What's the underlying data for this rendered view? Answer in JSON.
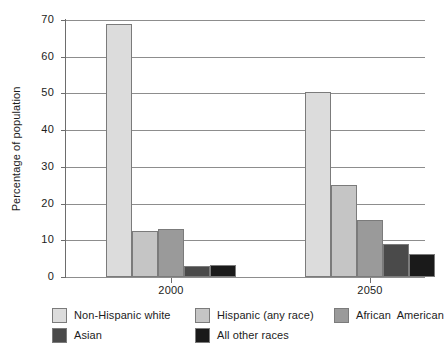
{
  "chart_data": {
    "type": "bar",
    "title": "",
    "xlabel": "",
    "ylabel": "Percentage of population",
    "ylim": [
      0,
      70
    ],
    "ytick_step": 10,
    "yticks": [
      "70",
      "60",
      "50",
      "40",
      "30",
      "20",
      "10",
      "0"
    ],
    "grid": true,
    "legend_position": "bottom",
    "categories": [
      "2000",
      "2050"
    ],
    "series": [
      {
        "name": "Non-Hispanic white",
        "color": "#dcdcdc",
        "values": [
          69.0,
          50.5
        ]
      },
      {
        "name": "Hispanic (any race)",
        "color": "#c5c5c5",
        "values": [
          12.5,
          25.0
        ]
      },
      {
        "name": "African  American",
        "color": "#9a9a9a",
        "values": [
          13.0,
          15.5
        ]
      },
      {
        "name": "Asian",
        "color": "#4a4a4a",
        "values": [
          3.0,
          9.0
        ]
      },
      {
        "name": "All other races",
        "color": "#1a1a1a",
        "values": [
          3.3,
          6.3
        ]
      }
    ]
  },
  "axes": {
    "y_axis_label": "Percentage of population",
    "y_ticks": [
      "70",
      "60",
      "50",
      "40",
      "30",
      "20",
      "10",
      "0"
    ],
    "x_ticks": [
      "2000",
      "2050"
    ]
  },
  "legend": {
    "entries": [
      {
        "label": "Non-Hispanic white",
        "color": "#dcdcdc"
      },
      {
        "label": "Hispanic (any race)",
        "color": "#c5c5c5"
      },
      {
        "label": "African  American",
        "color": "#9a9a9a"
      },
      {
        "label": "Asian",
        "color": "#4a4a4a"
      },
      {
        "label": "All other races",
        "color": "#1a1a1a"
      }
    ]
  }
}
